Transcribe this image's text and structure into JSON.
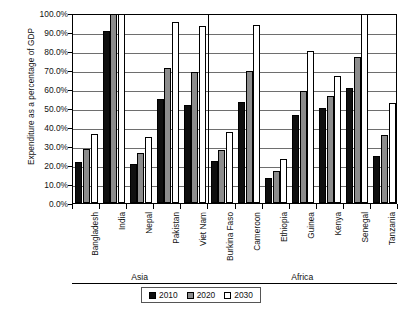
{
  "chart_data": {
    "type": "bar",
    "title": "",
    "subtitle": "",
    "xlabel": "",
    "ylabel": "Expenditure as a percentage of GDP",
    "ylim": [
      0,
      100
    ],
    "ytick_labels": [
      "100.0%",
      "90.0%",
      "80.0%",
      "70.0%",
      "60.0%",
      "50.0%",
      "40.0%",
      "30.0%",
      "20.0%",
      "10.0%",
      "0.0%"
    ],
    "ytick_values": [
      100,
      90,
      80,
      70,
      60,
      50,
      40,
      30,
      20,
      10,
      0
    ],
    "grid": true,
    "legend_position": "bottom-center",
    "value_unit": "percent",
    "note_clipped": "Bars exceeding 100% are clipped at the top of the plot area",
    "categories": [
      "Bangladesh",
      "India",
      "Nepal",
      "Pakistan",
      "Viet Nam",
      "Burkina Faso",
      "Cameroon",
      "Ethiopia",
      "Guinea",
      "Kenya",
      "Senegal",
      "Tanzania"
    ],
    "series": [
      {
        "name": "2010",
        "color": "#0f0f0f",
        "values": [
          21.8,
          90.3,
          20.3,
          55.0,
          51.8,
          21.9,
          53.4,
          13.3,
          46.5,
          50.2,
          60.4,
          24.9
        ]
      },
      {
        "name": "2020",
        "color": "#8c8c8c",
        "values": [
          28.2,
          100.0,
          26.4,
          71.0,
          69.2,
          27.8,
          69.4,
          16.7,
          59.0,
          56.3,
          76.6,
          35.6
        ]
      },
      {
        "name": "2030",
        "color": "#ffffff",
        "values": [
          36.3,
          100.0,
          34.5,
          95.5,
          93.4,
          37.6,
          93.5,
          23.0,
          79.8,
          66.8,
          100.0,
          52.6
        ]
      }
    ],
    "groups": [
      {
        "label": "Asia",
        "categories": [
          "Bangladesh",
          "India",
          "Nepal",
          "Pakistan",
          "Viet Nam"
        ]
      },
      {
        "label": "Africa",
        "categories": [
          "Burkina Faso",
          "Cameroon",
          "Ethiopia",
          "Guinea",
          "Kenya",
          "Senegal",
          "Tanzania"
        ]
      }
    ]
  },
  "legend": {
    "items": [
      {
        "label": "2010",
        "swatch": "black-square-icon"
      },
      {
        "label": "2020",
        "swatch": "gray-square-icon"
      },
      {
        "label": "2030",
        "swatch": "white-square-icon"
      }
    ]
  }
}
